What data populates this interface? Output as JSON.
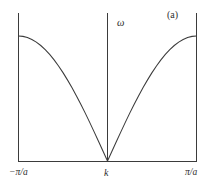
{
  "figure": {
    "panel_label": "(a)",
    "y_axis_label": "ω",
    "x_axis_label": "k",
    "x_tick_min_label": "−π/a",
    "x_tick_max_label": "π/a",
    "line_color": "#3b3b3b",
    "axis_color": "#3b3b3b",
    "background_color": "#ffffff"
  },
  "chart_data": {
    "type": "line",
    "title": "(a)",
    "subtitle": "",
    "xlabel": "k",
    "ylabel": "ω",
    "grid": false,
    "legend_position": "none",
    "annotations": [
      "(a)"
    ],
    "xlim": [
      -1,
      1
    ],
    "ylim": [
      0,
      1
    ],
    "xtick_values": [
      -1,
      0,
      1
    ],
    "xtick_labels": [
      "−π/a",
      "k",
      "π/a"
    ],
    "ytick_values": [],
    "ytick_labels": [],
    "series": [
      {
        "name": "ω(k) = ω_max |sin(ka/2)|",
        "x": [
          -1.0,
          -0.95,
          -0.9,
          -0.85,
          -0.8,
          -0.75,
          -0.7,
          -0.65,
          -0.6,
          -0.55,
          -0.5,
          -0.45,
          -0.4,
          -0.35,
          -0.3,
          -0.25,
          -0.2,
          -0.15,
          -0.1,
          -0.05,
          0.0,
          0.05,
          0.1,
          0.15,
          0.2,
          0.25,
          0.3,
          0.35,
          0.4,
          0.45,
          0.5,
          0.55,
          0.6,
          0.65,
          0.7,
          0.75,
          0.8,
          0.85,
          0.9,
          0.95,
          1.0
        ],
        "y": [
          1.0,
          0.997,
          0.988,
          0.972,
          0.951,
          0.924,
          0.891,
          0.853,
          0.809,
          0.76,
          0.707,
          0.649,
          0.588,
          0.522,
          0.454,
          0.383,
          0.309,
          0.233,
          0.156,
          0.078,
          0.0,
          0.078,
          0.156,
          0.233,
          0.309,
          0.383,
          0.454,
          0.522,
          0.588,
          0.649,
          0.707,
          0.76,
          0.809,
          0.853,
          0.891,
          0.924,
          0.951,
          0.972,
          0.988,
          0.997,
          1.0
        ]
      }
    ]
  }
}
